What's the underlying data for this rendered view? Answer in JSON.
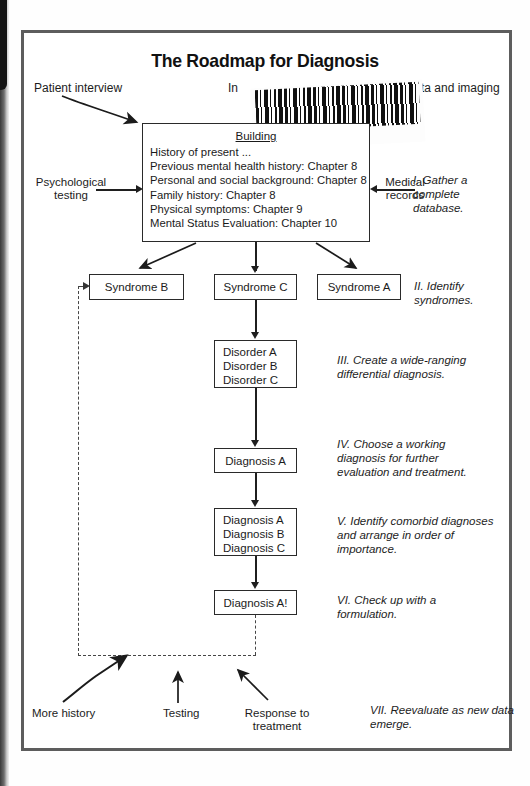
{
  "page": {
    "title": "The Roadmap for Diagnosis"
  },
  "barcode": {
    "code": "D0745045"
  },
  "inputs": {
    "patient_interview": "Patient interview",
    "informants_partial": "In",
    "lab_partial": "ta and imaging",
    "psychological_testing_line1": "Psychological",
    "psychological_testing_line2": "testing",
    "medical_records_line1": "Medical",
    "medical_records_line2": "records"
  },
  "database_box": {
    "header": "Building",
    "items": [
      "History of present ...",
      "Previous mental health history: Chapter 8",
      "Personal and social background: Chapter 8",
      "Family history: Chapter 8",
      "Physical symptoms: Chapter 9",
      "Mental Status Evaluation: Chapter 10"
    ]
  },
  "syndromes": [
    {
      "label": "Syndrome B"
    },
    {
      "label": "Syndrome C"
    },
    {
      "label": "Syndrome A"
    }
  ],
  "disorder_box": {
    "items": [
      "Disorder A",
      "Disorder B",
      "Disorder C"
    ]
  },
  "working_diagnosis_box": {
    "items": [
      "Diagnosis A"
    ]
  },
  "comorbid_box": {
    "items": [
      "Diagnosis A",
      "Diagnosis B",
      "Diagnosis C"
    ]
  },
  "final_box": {
    "items": [
      "Diagnosis A!"
    ]
  },
  "feedback": {
    "more_history": "More history",
    "testing": "Testing",
    "response_line1": "Response to",
    "response_line2": "treatment"
  },
  "steps": [
    {
      "num": "I.",
      "text": "Gather a complete database."
    },
    {
      "num": "II.",
      "text": "Identify syndromes."
    },
    {
      "num": "III.",
      "text": "Create a wide-ranging differential diagnosis."
    },
    {
      "num": "IV.",
      "text": "Choose a working diagnosis for further evaluation and treatment."
    },
    {
      "num": "V.",
      "text": "Identify comorbid diagnoses and arrange in order of importance."
    },
    {
      "num": "VI.",
      "text": "Check up with a formulation."
    },
    {
      "num": "VII.",
      "text": "Reevaluate as new data emerge."
    }
  ],
  "colors": {
    "ink": "#1c1c1c",
    "frame": "#5d5d5d",
    "paper": "#ffffff"
  }
}
